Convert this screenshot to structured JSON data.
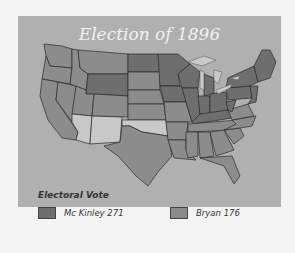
{
  "map": {
    "title": "Election of 1896",
    "legend": {
      "title": "Electoral Vote",
      "items": [
        {
          "label": "Mc Kinley 271",
          "color": "#6e6e6e"
        },
        {
          "label": "Bryan 176",
          "color": "#8c8c8c"
        }
      ]
    },
    "colors": {
      "panel": "#b0b0b0",
      "mckinley": "#6e6e6e",
      "bryan": "#8c8c8c",
      "territory": "#c9c9c9",
      "border": "#2a2a2a"
    }
  }
}
